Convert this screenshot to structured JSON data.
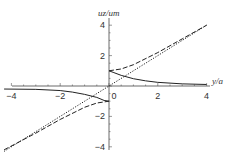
{
  "chart_data": {
    "type": "line",
    "title": "",
    "xlabel": "y/a",
    "ylabel": "u_z/u_m",
    "xlim": [
      -4.3,
      4.3
    ],
    "ylim": [
      -4.2,
      4.2
    ],
    "xticks": [
      "-4",
      "-2",
      "0",
      "2",
      "4"
    ],
    "yticks": [
      "4",
      "2",
      "-2",
      "-4"
    ],
    "grid": false,
    "legend": null,
    "series": [
      {
        "name": "solid",
        "style": "solid",
        "x": [
          -4.3,
          -3,
          -2,
          -1.5,
          -1,
          -0.5,
          -0.2,
          0,
          0,
          0.2,
          0.5,
          1,
          1.5,
          2,
          3,
          4
        ],
        "y": [
          -0.2,
          -0.22,
          -0.3,
          -0.4,
          -0.55,
          -0.75,
          -0.95,
          -1.0,
          1.0,
          0.88,
          0.7,
          0.48,
          0.34,
          0.24,
          0.14,
          0.1
        ]
      },
      {
        "name": "dashed",
        "style": "dashed",
        "x": [
          -4.3,
          -3,
          -2,
          -1,
          -0.5,
          0,
          0,
          0.5,
          1,
          2,
          3,
          4
        ],
        "y": [
          -4.2,
          -3.1,
          -2.2,
          -1.4,
          -1.12,
          -1.0,
          1.0,
          1.12,
          1.4,
          2.2,
          3.1,
          4.0
        ]
      },
      {
        "name": "dotted",
        "style": "dotted",
        "x": [
          -4.3,
          4
        ],
        "y": [
          -4.3,
          4
        ]
      }
    ]
  }
}
